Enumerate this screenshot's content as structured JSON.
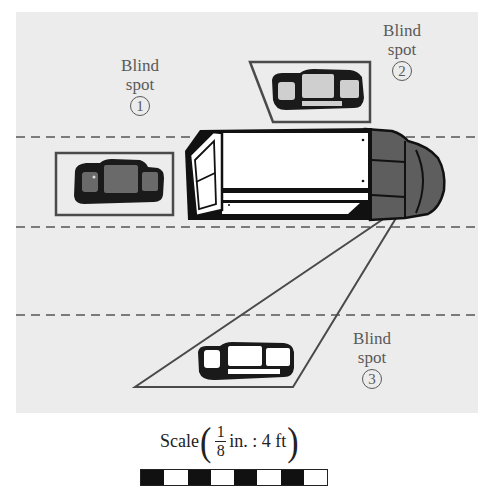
{
  "figure": {
    "colors": {
      "road": "#ececec",
      "lane_dash": "#555555",
      "outline": "#4a4a4a",
      "truck_body": "#ffffff",
      "truck_cab": "#5e5e5e",
      "car_dark": "#1a1a1a",
      "label_text": "#5a5a5a"
    }
  },
  "labels": [
    {
      "id": "blind-spot-1",
      "line1": "Blind",
      "line2": "spot",
      "number": "1"
    },
    {
      "id": "blind-spot-2",
      "line1": "Blind",
      "line2": "spot",
      "number": "2"
    },
    {
      "id": "blind-spot-3",
      "line1": "Blind",
      "line2": "spot",
      "number": "3"
    }
  ],
  "scale": {
    "prefix": "Scale",
    "numerator": "1",
    "denominator": "8",
    "suffix": "in. : 4 ft",
    "segments": [
      "dark",
      "light",
      "dark",
      "light",
      "dark",
      "light",
      "dark",
      "light"
    ]
  }
}
